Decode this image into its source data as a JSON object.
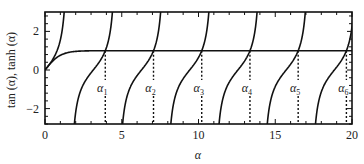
{
  "chart_data": {
    "type": "line",
    "title": "",
    "xlabel": "α",
    "ylabel": "tan (α), tanh (α)",
    "xlim": [
      0,
      20
    ],
    "ylim": [
      -3,
      3
    ],
    "xticks": [
      0,
      5,
      10,
      15,
      20
    ],
    "xtick_labels": [
      "0",
      "5",
      "10",
      "15",
      "20"
    ],
    "yticks": [
      -2,
      0,
      2
    ],
    "ytick_labels": [
      "−2",
      "0",
      "2"
    ],
    "grid": false,
    "legend": null,
    "series": [
      {
        "name": "tan(α)",
        "function": "tan",
        "branches_visible": 7
      },
      {
        "name": "tanh(α)",
        "function": "tanh"
      }
    ],
    "annotations": [
      {
        "label": "α1",
        "x": 3.927
      },
      {
        "label": "α2",
        "x": 7.069
      },
      {
        "label": "α3",
        "x": 10.21
      },
      {
        "label": "α4",
        "x": 13.352
      },
      {
        "label": "α5",
        "x": 16.493
      },
      {
        "label": "α6",
        "x": 19.635
      }
    ],
    "annotation_style": "dashed vertical lines from intersection to x-axis"
  }
}
